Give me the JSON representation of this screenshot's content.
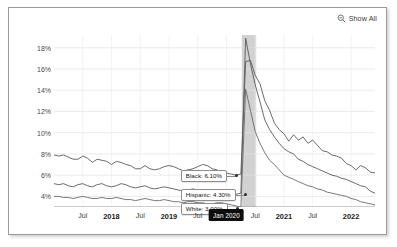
{
  "controls": {
    "show_all_label": "Show All",
    "show_all_icon": "magnifier-minus-icon"
  },
  "chart_data": {
    "type": "line",
    "title": "",
    "subtitle": "",
    "xlabel": "",
    "ylabel": "",
    "grid": true,
    "legend_position": "inline-callout",
    "ylim": [
      3.0,
      19.2
    ],
    "yticks": [
      "4%",
      "6%",
      "8%",
      "10%",
      "12%",
      "14%",
      "16%",
      "18%"
    ],
    "ytick_values": [
      4,
      6,
      8,
      10,
      12,
      14,
      16,
      18
    ],
    "xtick_labels": [
      "Jul",
      "2018",
      "Jul",
      "2019",
      "Jul",
      "Jan 2020",
      "Jul",
      "2021",
      "Jul",
      "2022"
    ],
    "xtick_highlighted": "Jan 2020",
    "xlim": [
      "2017-01",
      "2022-03"
    ],
    "shaded_region": {
      "label": "recession",
      "start": "2020-02",
      "end": "2020-04",
      "color": "#c9c9c9"
    },
    "annotations": [
      {
        "text": "Black: 6.10%",
        "series": "Black",
        "value": 6.1
      },
      {
        "text": "Hispanic: 4.30%",
        "series": "Hispanic",
        "value": 4.3
      },
      {
        "text": "White: 3.00%",
        "series": "White",
        "value": 3.0
      }
    ],
    "series": [
      {
        "name": "Black",
        "color": "#5a5a5a",
        "peak": 18.9,
        "final": 6.2,
        "values": [
          7.9,
          7.8,
          7.9,
          7.7,
          7.5,
          7.5,
          7.8,
          7.6,
          7.2,
          7.5,
          7.4,
          7.3,
          7.0,
          7.3,
          7.2,
          7.0,
          6.9,
          6.6,
          6.6,
          6.9,
          6.6,
          6.5,
          6.6,
          6.8,
          6.9,
          6.8,
          6.6,
          6.4,
          6.5,
          6.6,
          6.8,
          7.0,
          6.9,
          6.6,
          6.5,
          6.3,
          6.2,
          6.1,
          6.0,
          6.1,
          16.7,
          16.8,
          15.4,
          14.6,
          13.0,
          12.1,
          10.9,
          10.3,
          9.9,
          9.2,
          9.8,
          9.3,
          9.6,
          9.0,
          9.3,
          8.8,
          8.3,
          8.2,
          7.9,
          7.8,
          7.6,
          7.1,
          6.9,
          6.5,
          6.9,
          6.7,
          6.3,
          6.2
        ]
      },
      {
        "name": "Hispanic",
        "color": "#5a5a5a",
        "peak": 18.9,
        "final": 4.3,
        "values": [
          5.2,
          5.1,
          5.2,
          5.0,
          4.9,
          5.1,
          5.2,
          5.0,
          4.9,
          5.1,
          5.2,
          5.0,
          4.9,
          5.0,
          5.2,
          5.1,
          4.9,
          4.8,
          4.9,
          5.0,
          4.8,
          4.7,
          4.8,
          4.9,
          4.8,
          4.7,
          4.6,
          4.5,
          4.6,
          4.7,
          4.6,
          4.5,
          4.4,
          4.3,
          4.4,
          4.5,
          4.4,
          4.3,
          4.2,
          4.3,
          18.9,
          16.5,
          14.5,
          12.9,
          11.2,
          10.3,
          9.6,
          9.0,
          8.5,
          8.2,
          8.0,
          7.5,
          7.3,
          7.0,
          6.8,
          6.6,
          6.4,
          6.2,
          6.0,
          5.9,
          5.7,
          5.6,
          5.4,
          5.2,
          5.0,
          4.9,
          4.5,
          4.3
        ]
      },
      {
        "name": "White",
        "color": "#6a6a6a",
        "peak": 14.1,
        "final": 3.2,
        "values": [
          4.0,
          4.0,
          3.9,
          3.9,
          3.8,
          3.9,
          4.0,
          3.9,
          3.8,
          3.8,
          3.9,
          3.8,
          3.8,
          3.9,
          3.8,
          3.7,
          3.7,
          3.6,
          3.7,
          3.8,
          3.7,
          3.6,
          3.6,
          3.7,
          3.6,
          3.5,
          3.5,
          3.4,
          3.5,
          3.5,
          3.4,
          3.4,
          3.3,
          3.3,
          3.4,
          3.4,
          3.3,
          3.2,
          3.1,
          3.0,
          14.1,
          12.1,
          10.1,
          9.0,
          8.1,
          7.4,
          7.0,
          6.5,
          6.0,
          5.8,
          5.6,
          5.4,
          5.2,
          5.0,
          4.9,
          4.7,
          4.6,
          4.4,
          4.3,
          4.2,
          4.1,
          4.0,
          3.8,
          3.7,
          3.5,
          3.4,
          3.3,
          3.2
        ]
      }
    ]
  }
}
